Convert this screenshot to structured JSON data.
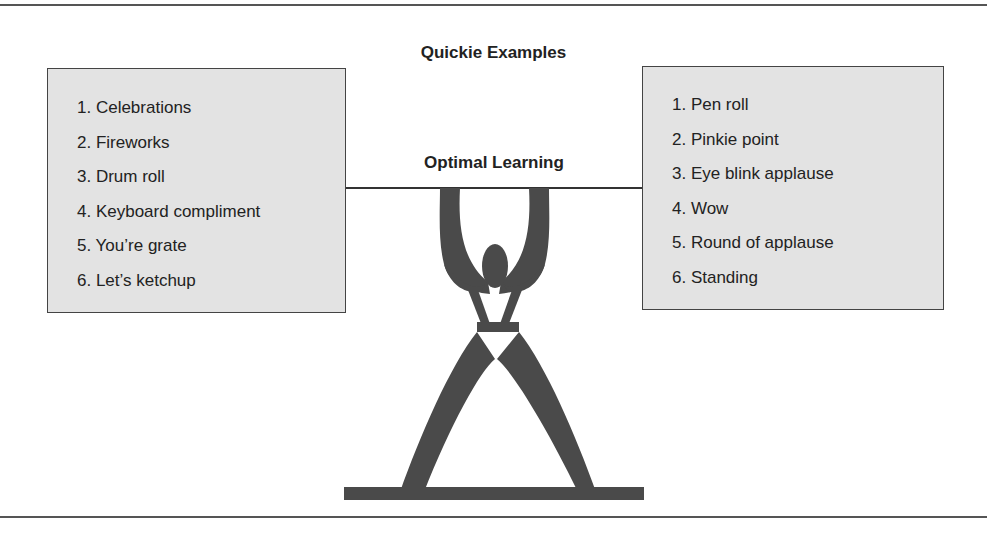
{
  "title": "Quickie Examples",
  "bar_label": "Optimal Learning",
  "left_list": {
    "items": [
      "1. Celebrations",
      "2. Fireworks",
      "3. Drum roll",
      "4. Keyboard compliment",
      "5. You’re grate",
      "6. Let’s ketchup"
    ]
  },
  "right_list": {
    "items": [
      "1. Pen roll",
      "2. Pinkie point",
      "3. Eye blink applause",
      "4. Wow",
      "5. Round of applause",
      "6. Standing"
    ]
  },
  "figure": {
    "icon": "weightlifter-icon",
    "fill_color": "#4a4a4a"
  },
  "colors": {
    "box_fill": "#e3e3e3",
    "box_border": "#444444",
    "text": "#222222",
    "rule": "#555555"
  }
}
